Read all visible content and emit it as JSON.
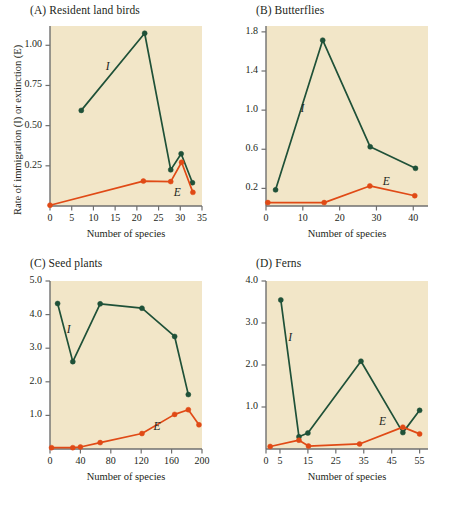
{
  "figure": {
    "axis_titles": {
      "y": "Rate of immigration (I) or extinction (E)",
      "x": "Number of species"
    },
    "colors": {
      "immigration": "#1f5138",
      "extinction": "#e04a16",
      "plot_background": "#f2e6c8",
      "axis": "#6f6f6f",
      "text": "#231f20"
    },
    "series_labels": {
      "immigration": "I",
      "extinction": "E"
    }
  },
  "chart_data": [
    {
      "type": "line",
      "panel": "A",
      "title": "(A)  Resident land birds",
      "xlabel": "Number of species",
      "ylabel": "Rate of immigration (I) or extinction (E)",
      "xlim": [
        0,
        35
      ],
      "ylim": [
        0,
        1.12
      ],
      "xticks": [
        0,
        5,
        10,
        15,
        20,
        25,
        30,
        35
      ],
      "xticklabels": [
        "0",
        "5",
        "10",
        "15",
        "20",
        "25",
        "30",
        "35"
      ],
      "yticks": [
        0.25,
        0.5,
        0.75,
        1.0
      ],
      "yticklabels": [
        "0.25",
        "0.50",
        "0.75",
        "1.00"
      ],
      "grid": false,
      "legend": "inline-annotation",
      "series": [
        {
          "name": "I",
          "label": "Immigration",
          "color": "#1f5138",
          "x": [
            7.2,
            21.8,
            27.8,
            30.2,
            32.8
          ],
          "y": [
            0.595,
            1.075,
            0.225,
            0.325,
            0.145
          ]
        },
        {
          "name": "E",
          "label": "Extinction",
          "color": "#e04a16",
          "x": [
            0,
            21.5,
            27.8,
            30.3,
            32.9
          ],
          "y": [
            0.005,
            0.155,
            0.152,
            0.272,
            0.085
          ]
        }
      ],
      "annotations": [
        {
          "text": "I",
          "x": 13.5,
          "y": 0.86
        },
        {
          "text": "E",
          "x": 29.2,
          "y": 0.075
        }
      ]
    },
    {
      "type": "line",
      "panel": "B",
      "title": "(B)  Butterflies",
      "xlabel": "Number of species",
      "ylabel": "Rate of immigration (I) or extinction (E)",
      "xlim": [
        0,
        44
      ],
      "ylim": [
        0.02,
        1.86
      ],
      "xticks": [
        0,
        10,
        20,
        30,
        40
      ],
      "xticklabels": [
        "0",
        "10",
        "20",
        "30",
        "40"
      ],
      "yticks": [
        0.2,
        0.6,
        1.0,
        1.4,
        1.8
      ],
      "yticklabels": [
        "0.2",
        "0.6",
        "1.0",
        "1.4",
        "1.8"
      ],
      "grid": false,
      "legend": "inline-annotation",
      "series": [
        {
          "name": "I",
          "label": "Immigration",
          "color": "#1f5138",
          "x": [
            2.6,
            15.4,
            28.3,
            40.6
          ],
          "y": [
            0.185,
            1.715,
            0.625,
            0.405
          ]
        },
        {
          "name": "E",
          "label": "Extinction",
          "color": "#e04a16",
          "x": [
            0.5,
            15.8,
            28.2,
            40.4
          ],
          "y": [
            0.055,
            0.055,
            0.225,
            0.125
          ]
        }
      ],
      "annotations": [
        {
          "text": "I",
          "x": 10.2,
          "y": 1.0
        },
        {
          "text": "E",
          "x": 32.5,
          "y": 0.255
        }
      ]
    },
    {
      "type": "line",
      "panel": "C",
      "title": "(C)  Seed plants",
      "xlabel": "Number of species",
      "ylabel": "Rate of immigration (I) or extinction (E)",
      "xlim": [
        0,
        200
      ],
      "ylim": [
        0,
        5.0
      ],
      "xticks": [
        0,
        40,
        80,
        120,
        160,
        200
      ],
      "xticklabels": [
        "0",
        "40",
        "80",
        "120",
        "160",
        "200"
      ],
      "yticks": [
        1.0,
        2.0,
        3.0,
        4.0,
        5.0
      ],
      "yticklabels": [
        "1.0",
        "2.0",
        "3.0",
        "4.0",
        "5.0"
      ],
      "grid": false,
      "legend": "inline-annotation",
      "series": [
        {
          "name": "I",
          "label": "Immigration",
          "color": "#1f5138",
          "x": [
            10,
            30,
            66,
            121,
            164,
            182
          ],
          "y": [
            4.33,
            2.6,
            4.32,
            4.19,
            3.35,
            1.62
          ]
        },
        {
          "name": "E",
          "label": "Extinction",
          "color": "#e04a16",
          "x": [
            2,
            30,
            40,
            66,
            121,
            164,
            182,
            196
          ],
          "y": [
            0.04,
            0.04,
            0.06,
            0.19,
            0.46,
            1.03,
            1.17,
            0.72
          ]
        }
      ],
      "annotations": [
        {
          "text": "I",
          "x": 26,
          "y": 3.52
        },
        {
          "text": "E",
          "x": 140,
          "y": 0.62
        }
      ]
    },
    {
      "type": "line",
      "panel": "D",
      "title": "(D)  Ferns",
      "xlabel": "Number of species",
      "ylabel": "Rate of immigration (I) or extinction (E)",
      "xlim": [
        0,
        58
      ],
      "ylim": [
        0,
        4.0
      ],
      "xticks": [
        0,
        5,
        15,
        25,
        35,
        45,
        55
      ],
      "xticklabels": [
        "0",
        "5",
        "15",
        "25",
        "35",
        "45",
        "55"
      ],
      "yticks": [
        1.0,
        2.0,
        3.0,
        4.0
      ],
      "yticklabels": [
        "1.0",
        "2.0",
        "3.0",
        "4.0"
      ],
      "grid": false,
      "legend": "inline-annotation",
      "series": [
        {
          "name": "I",
          "label": "Immigration",
          "color": "#1f5138",
          "x": [
            5.3,
            11.8,
            15.0,
            34.0,
            49.0,
            55.0
          ],
          "y": [
            3.55,
            0.29,
            0.38,
            2.09,
            0.39,
            0.92
          ]
        },
        {
          "name": "E",
          "label": "Extinction",
          "color": "#e04a16",
          "x": [
            1.5,
            11.8,
            15.2,
            33.5,
            49.0,
            55.0
          ],
          "y": [
            0.06,
            0.21,
            0.07,
            0.12,
            0.52,
            0.36
          ]
        }
      ],
      "annotations": [
        {
          "text": "I",
          "x": 9.0,
          "y": 2.62
        },
        {
          "text": "E",
          "x": 41.5,
          "y": 0.62
        }
      ]
    }
  ]
}
